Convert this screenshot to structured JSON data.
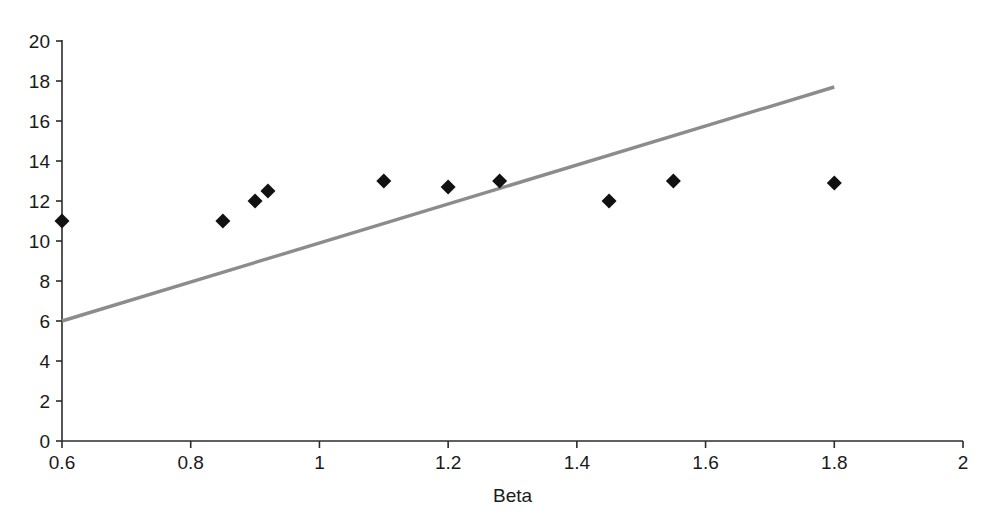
{
  "chart_data": {
    "type": "scatter",
    "title": "",
    "subtitle": "",
    "xlabel": "Beta",
    "ylabel": "",
    "xlim": [
      0.6,
      2
    ],
    "ylim": [
      0,
      20
    ],
    "grid": false,
    "legend": null,
    "x_ticks": [
      "0.6",
      "0.8",
      "1",
      "1.2",
      "1.4",
      "1.6",
      "1.8",
      "2"
    ],
    "x_tick_values": [
      0.6,
      0.8,
      1,
      1.2,
      1.4,
      1.6,
      1.8,
      2
    ],
    "y_ticks": [
      "0",
      "2",
      "4",
      "6",
      "8",
      "10",
      "12",
      "14",
      "16",
      "18",
      "20"
    ],
    "y_tick_values": [
      0,
      2,
      4,
      6,
      8,
      10,
      12,
      14,
      16,
      18,
      20
    ],
    "series": [
      {
        "name": "data-points",
        "type": "scatter",
        "marker": "diamond",
        "color": "#111111",
        "points": [
          {
            "x": 0.6,
            "y": 11
          },
          {
            "x": 0.85,
            "y": 11
          },
          {
            "x": 0.9,
            "y": 12
          },
          {
            "x": 0.92,
            "y": 12.5
          },
          {
            "x": 1.1,
            "y": 13
          },
          {
            "x": 1.2,
            "y": 12.7
          },
          {
            "x": 1.28,
            "y": 13
          },
          {
            "x": 1.45,
            "y": 12
          },
          {
            "x": 1.55,
            "y": 13
          },
          {
            "x": 1.8,
            "y": 12.9
          }
        ]
      },
      {
        "name": "trend-line",
        "type": "line",
        "color": "#8c8c8c",
        "points": [
          {
            "x": 0.6,
            "y": 6
          },
          {
            "x": 1.8,
            "y": 17.7
          }
        ]
      }
    ]
  },
  "axes": {
    "x_axis_label": "Beta"
  }
}
